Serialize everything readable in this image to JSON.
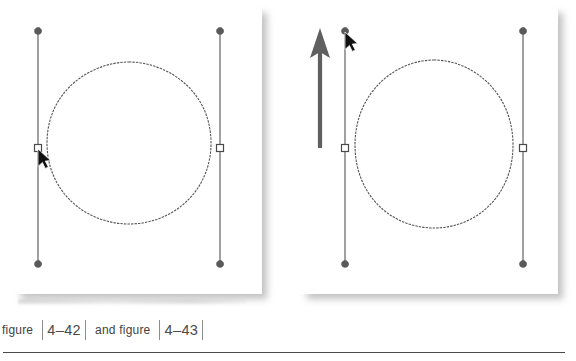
{
  "document": {
    "caption": {
      "text_before": "figure",
      "reference_1": "4–42",
      "text_between": "and figure",
      "reference_2": "4–43",
      "bracket_glyph": "|"
    },
    "colors": {
      "page_background": "#ffffff",
      "panel_background": "#ffffff",
      "shadow": "#78787d",
      "path_stroke": "#555555",
      "handle_line": "#6e6e6e",
      "handle_endpoint": "#5a5a5a",
      "anchor_fill": "#ffffff",
      "anchor_stroke": "#4a4a4a",
      "cursor": "#111111",
      "motion_arrow": "#5f5f5f",
      "rule": "#4a4a4a",
      "caption_text": "#3f3f3f"
    }
  },
  "figures": [
    {
      "id": "figure-4-42",
      "name": "circle-with-direction-handles-before",
      "position": "left",
      "description": "Vector circle path with two vertical bezier direction handles; pointer is selecting the left anchor point.",
      "shape": {
        "type": "circle-path",
        "center_x": 129,
        "center_y": 143,
        "radius_x": 91,
        "radius_y": 81
      },
      "handles": [
        {
          "name": "left-direction-handle",
          "x": 38,
          "top_y": 31,
          "bottom_y": 264,
          "anchor_y": 148,
          "anchor_shape": "hollow-square",
          "endpoint_shape": "diamond"
        },
        {
          "name": "right-direction-handle",
          "x": 220,
          "top_y": 31,
          "bottom_y": 264,
          "anchor_y": 148,
          "anchor_shape": "hollow-square",
          "endpoint_shape": "diamond"
        }
      ],
      "cursor": {
        "name": "arrow-pointer",
        "x": 38,
        "y": 148
      },
      "motion_arrow": null
    },
    {
      "id": "figure-4-43",
      "name": "circle-with-direction-handles-after",
      "position": "right",
      "description": "Same circle path after dragging the left direction handle endpoint upward; a large arrow indicates the upward drag direction.",
      "shape": {
        "type": "circle-path",
        "center_x": 434,
        "center_y": 143,
        "radius_x": 89,
        "radius_y": 83
      },
      "handles": [
        {
          "name": "left-direction-handle",
          "x": 345,
          "top_y": 31,
          "bottom_y": 264,
          "anchor_y": 148,
          "anchor_shape": "hollow-square",
          "endpoint_shape": "diamond"
        },
        {
          "name": "right-direction-handle",
          "x": 523,
          "top_y": 31,
          "bottom_y": 264,
          "anchor_y": 148,
          "anchor_shape": "hollow-square",
          "endpoint_shape": "diamond"
        }
      ],
      "cursor": {
        "name": "arrow-pointer",
        "x": 345,
        "y": 33
      },
      "motion_arrow": {
        "name": "upward-drag-arrow",
        "x": 320,
        "tail_y": 146,
        "head_y": 36,
        "direction": "up"
      }
    }
  ]
}
